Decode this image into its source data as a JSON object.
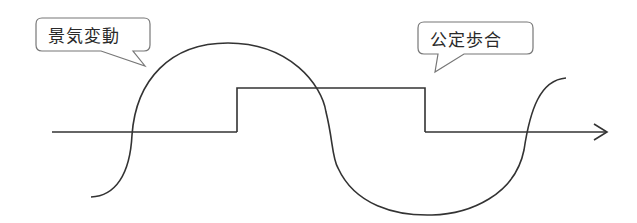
{
  "diagram": {
    "title": "",
    "callouts": [
      {
        "id": "business-fluctuation",
        "label": "景気変動"
      },
      {
        "id": "official-discount-rate",
        "label": "公定歩合"
      }
    ],
    "elements": {
      "wave": "business-cycle-wave",
      "step": "discount-rate-step-line",
      "axis": "time-axis-arrow"
    },
    "colors": {
      "stroke": "#333333",
      "callout_border": "#777777",
      "background": "#ffffff"
    }
  }
}
